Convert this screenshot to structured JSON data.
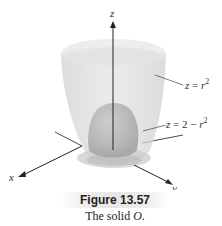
{
  "figure": {
    "number": "Figure 13.57",
    "caption_prefix": "The solid ",
    "caption_var": "O",
    "caption_suffix": "."
  },
  "axes": {
    "x_label": "x",
    "y_label": "y",
    "z_label": "z"
  },
  "surfaces": [
    {
      "name": "outer-paraboloid",
      "label": "z = r²",
      "lhs": "z = r",
      "exp": "2"
    },
    {
      "name": "inner-paraboloid",
      "label": "z = 2 − r²",
      "lhs": "z = 2 − r",
      "exp": "2"
    }
  ],
  "colors": {
    "outer_surface": "#d9d9d9",
    "inner_surface": "#b5b5b5",
    "axis": "#222222"
  }
}
